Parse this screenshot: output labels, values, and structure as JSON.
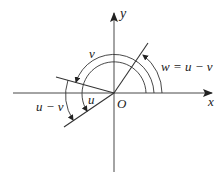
{
  "diagram": {
    "axes": {
      "x_label": "x",
      "y_label": "y",
      "origin_label": "O"
    },
    "angles": {
      "u_label": "u",
      "v_label": "v",
      "u_minus_v_label": "u − v",
      "w_label": "w = u − v"
    },
    "colors": {
      "stroke": "#333333",
      "background": "#ffffff"
    }
  }
}
